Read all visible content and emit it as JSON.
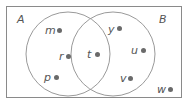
{
  "diagram": {
    "type": "venn",
    "universal_set": {
      "elements": [
        "w"
      ]
    },
    "sets": [
      {
        "name": "A",
        "label": "A",
        "only_elements": [
          "m",
          "r",
          "p"
        ]
      },
      {
        "name": "B",
        "label": "B",
        "only_elements": [
          "y",
          "u",
          "v"
        ]
      }
    ],
    "intersection": {
      "elements": [
        "t"
      ]
    },
    "colors": {
      "border": "#8a8a8a",
      "circle": "#9a9a9a",
      "dot": "#6a6a6a",
      "text": "#555555"
    }
  },
  "labels": {
    "set_a": "A",
    "set_b": "B",
    "m": "m",
    "r": "r",
    "p": "p",
    "t": "t",
    "y": "y",
    "u": "u",
    "v": "v",
    "w": "w"
  }
}
